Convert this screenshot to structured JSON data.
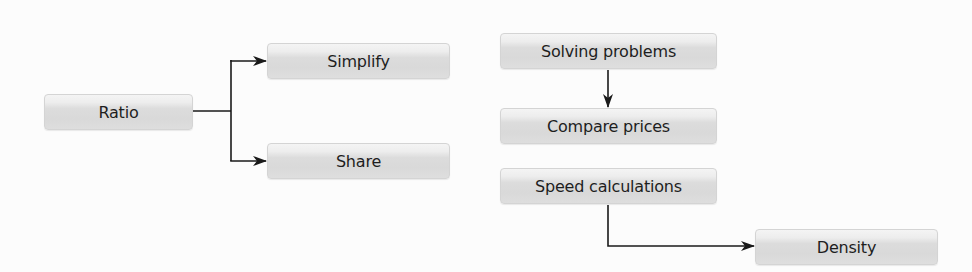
{
  "diagram": {
    "type": "flow",
    "nodes": [
      {
        "id": "ratio",
        "label": "Ratio"
      },
      {
        "id": "simplify",
        "label": "Simplify"
      },
      {
        "id": "share",
        "label": "Share"
      },
      {
        "id": "solving",
        "label": "Solving problems"
      },
      {
        "id": "compare",
        "label": "Compare prices"
      },
      {
        "id": "speed",
        "label": "Speed calculations"
      },
      {
        "id": "density",
        "label": "Density"
      }
    ],
    "edges": [
      {
        "from": "ratio",
        "to": "simplify"
      },
      {
        "from": "ratio",
        "to": "share"
      },
      {
        "from": "solving",
        "to": "compare"
      },
      {
        "from": "speed",
        "to": "density"
      }
    ],
    "colors": {
      "background": "#fcfcfc",
      "node_top": "#f4f4f4",
      "node_bottom": "#d9d9d9",
      "text": "#1e1e1e",
      "arrow": "#1a1a1a"
    }
  }
}
